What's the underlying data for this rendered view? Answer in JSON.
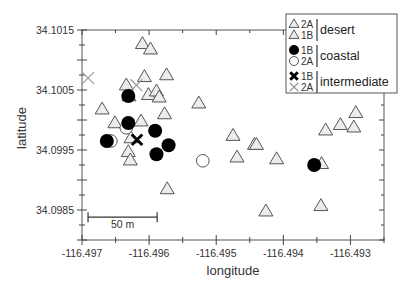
{
  "chart_data": {
    "type": "scatter",
    "title": "",
    "xlabel": "longitude",
    "ylabel": "latitude",
    "xlim": [
      -116.497,
      -116.4925
    ],
    "ylim": [
      34.098,
      34.1015
    ],
    "x_ticks": [
      "-116.497",
      "-116.496",
      "-116.495",
      "-116.494",
      "-116.493"
    ],
    "x_tick_values": [
      -116.497,
      -116.496,
      -116.495,
      -116.494,
      -116.493
    ],
    "y_ticks": [
      "34.1015",
      "34.1005",
      "34.0995",
      "34.0985"
    ],
    "y_tick_values": [
      34.1015,
      34.1005,
      34.0995,
      34.0985
    ],
    "grid": false,
    "legend_position": "upper right",
    "scale_bar": {
      "label": "50 m",
      "x_start": -116.49691,
      "x_end": -116.49588,
      "y": 34.09838
    },
    "legend": [
      {
        "group": "desert",
        "entries": [
          {
            "code": "2A",
            "marker": "triangle",
            "color": "#e6e6e6"
          },
          {
            "code": "1B",
            "marker": "triangle",
            "color": "#ffffff"
          }
        ]
      },
      {
        "group": "coastal",
        "entries": [
          {
            "code": "1B",
            "marker": "filled-circle",
            "color": "#000000"
          },
          {
            "code": "2A",
            "marker": "open-circle",
            "color": "#ffffff"
          }
        ]
      },
      {
        "group": "intermediate",
        "entries": [
          {
            "code": "1B",
            "marker": "bold-x",
            "color": "#000000"
          },
          {
            "code": "2A",
            "marker": "x",
            "color": "#aaaaaa"
          }
        ]
      }
    ],
    "series": [
      {
        "name": "desert 2A / 1B",
        "marker": "triangle",
        "points": [
          [
            -116.4961,
            34.10127
          ],
          [
            -116.49598,
            34.10118
          ],
          [
            -116.49607,
            34.10072
          ],
          [
            -116.49574,
            34.10075
          ],
          [
            -116.49601,
            34.10042
          ],
          [
            -116.49589,
            34.10048
          ],
          [
            -116.49585,
            34.10038
          ],
          [
            -116.49634,
            34.10058
          ],
          [
            -116.4963,
            34.1004
          ],
          [
            -116.4967,
            34.10018
          ],
          [
            -116.49651,
            34.09995
          ],
          [
            -116.49612,
            34.09998
          ],
          [
            -116.49627,
            34.0997
          ],
          [
            -116.49577,
            34.1001
          ],
          [
            -116.49526,
            34.10028
          ],
          [
            -116.49631,
            34.09947
          ],
          [
            -116.49628,
            34.09933
          ],
          [
            -116.49475,
            34.09974
          ],
          [
            -116.49443,
            34.09959
          ],
          [
            -116.4944,
            34.09959
          ],
          [
            -116.49469,
            34.09938
          ],
          [
            -116.4941,
            34.09935
          ],
          [
            -116.49426,
            34.09848
          ],
          [
            -116.49573,
            34.09885
          ],
          [
            -116.49343,
            34.09927
          ],
          [
            -116.49344,
            34.09857
          ],
          [
            -116.49292,
            34.10012
          ],
          [
            -116.49315,
            34.09992
          ],
          [
            -116.49295,
            34.09988
          ],
          [
            -116.49337,
            34.09983
          ]
        ]
      },
      {
        "name": "coastal 1B",
        "marker": "filled-circle",
        "points": [
          [
            -116.49631,
            34.1004
          ],
          [
            -116.49631,
            34.09995
          ],
          [
            -116.49663,
            34.09965
          ],
          [
            -116.49591,
            34.09982
          ],
          [
            -116.49571,
            34.09958
          ],
          [
            -116.49589,
            34.09943
          ],
          [
            -116.49354,
            34.09925
          ]
        ]
      },
      {
        "name": "coastal 2A",
        "marker": "open-circle",
        "points": [
          [
            -116.49634,
            34.09987
          ],
          [
            -116.49657,
            34.09965
          ],
          [
            -116.4952,
            34.09932
          ]
        ]
      },
      {
        "name": "intermediate 1B",
        "marker": "bold-x",
        "points": [
          [
            -116.49618,
            34.09967
          ]
        ]
      },
      {
        "name": "intermediate 2A",
        "marker": "x",
        "points": [
          [
            -116.49691,
            34.1007
          ],
          [
            -116.49619,
            34.10058
          ]
        ]
      }
    ]
  }
}
